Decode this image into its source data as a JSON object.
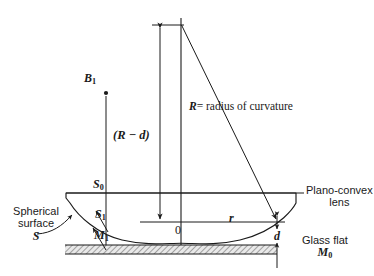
{
  "figure": {
    "kind": "optics-diagram",
    "ink_color": "#1a1a1a",
    "hatch_color": "#8a8a8a"
  },
  "labels": {
    "point_b1": {
      "letter": "B",
      "sub": "1"
    },
    "point_s0": {
      "letter": "S",
      "sub": "0"
    },
    "point_s1": {
      "letter": "S",
      "sub": "1"
    },
    "point_m1": {
      "letter": "M",
      "sub": "1"
    },
    "point_m0": {
      "letter": "M",
      "sub": "0"
    },
    "origin": "0",
    "radial_distance": "r",
    "gap_thickness": "d",
    "height_dimension": "(R − d)",
    "radius_symbol": "R",
    "radius_text": "= radius  of  curvature",
    "spherical_surface_line1": "Spherical",
    "spherical_surface_line2": "surface",
    "spherical_surface_symbol": "S",
    "lens_line1": "Plano-convex",
    "lens_line2": "lens",
    "glass_flat_text": "Glass flat"
  },
  "geometry": {
    "center_of_curvature": {
      "x": 181,
      "y": 25
    },
    "lens_top_y": 193,
    "contact_point": {
      "x": 181,
      "y": 243
    },
    "glass_flat_top_y": 245,
    "glass_flat_bottom_y": 254,
    "glass_flat_left_x": 65,
    "glass_flat_right_x": 277,
    "r_line_y": 222,
    "r_line_from_x": 140,
    "r_line_to_x": 285,
    "rim_contact_x": 277,
    "b1_line_x": 106,
    "b1_point_y": 93,
    "dim_line_x": 160
  }
}
